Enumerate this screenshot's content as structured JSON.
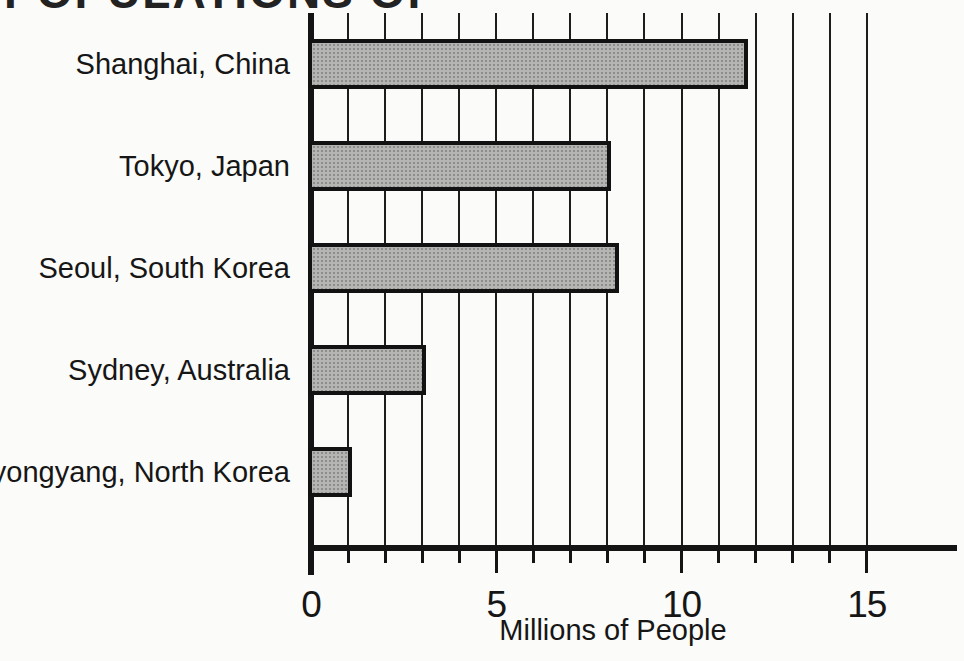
{
  "figure": {
    "title_visible_fragment": "POPULATIONS OF",
    "title_note": "title is cropped at the top edge of the image; only the bottom sliver of the letters is visible"
  },
  "chart_data": {
    "type": "bar",
    "orientation": "horizontal",
    "title": "POPULATIONS OF",
    "categories": [
      "Shanghai, China",
      "Tokyo, Japan",
      "Seoul, South Korea",
      "Sydney, Australia",
      "Pyongyang, North Korea"
    ],
    "values": [
      11.8,
      8.1,
      8.3,
      3.1,
      1.1
    ],
    "xlabel": "Millions of People",
    "ylabel": "",
    "xlim": [
      0,
      17.5
    ],
    "x_tick_interval": 1,
    "x_labeled_ticks": [
      0,
      5,
      10,
      15
    ],
    "x_labeled_tick_labels": [
      "0",
      "5",
      "10",
      "15"
    ],
    "grid": "vertical gridline at every 1 million from 0 to 15",
    "legend_position": "none",
    "style": {
      "background": "#fbfbf9",
      "ink": "#1a1a1a",
      "bar_fill": "#b5b5b3",
      "bar_pattern": "halftone-gray",
      "bar_border": "#121212"
    }
  }
}
